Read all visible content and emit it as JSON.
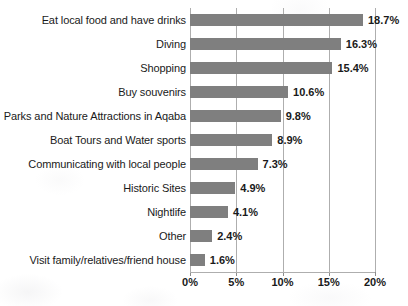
{
  "chart_data": {
    "type": "bar",
    "orientation": "horizontal",
    "title": "",
    "xlabel": "",
    "ylabel": "",
    "xlim": [
      0,
      20
    ],
    "grid": true,
    "legend": false,
    "value_suffix": "%",
    "xticks": [
      "0%",
      "5%",
      "10%",
      "15%",
      "20%"
    ],
    "xtick_values": [
      0,
      5,
      10,
      15,
      20
    ],
    "categories": [
      "Eat local food and have drinks",
      "Diving",
      "Shopping",
      "Buy souvenirs",
      "Parks and Nature Attractions in Aqaba",
      "Boat Tours and Water sports",
      "Communicating with local people",
      "Historic Sites",
      "Nightlife",
      "Other",
      "Visit family/relatives/friend house"
    ],
    "values": [
      18.7,
      16.3,
      15.4,
      10.6,
      9.8,
      8.9,
      7.3,
      4.9,
      4.1,
      2.4,
      1.6
    ],
    "data_labels": [
      "18.7%",
      "16.3%",
      "15.4%",
      "10.6%",
      "9.8%",
      "8.9%",
      "7.3%",
      "4.9%",
      "4.1%",
      "2.4%",
      "1.6%"
    ],
    "bar_color": "#7f7f7f",
    "gridline_color": "#aeaeae",
    "text_color": "#1a1a1a"
  }
}
